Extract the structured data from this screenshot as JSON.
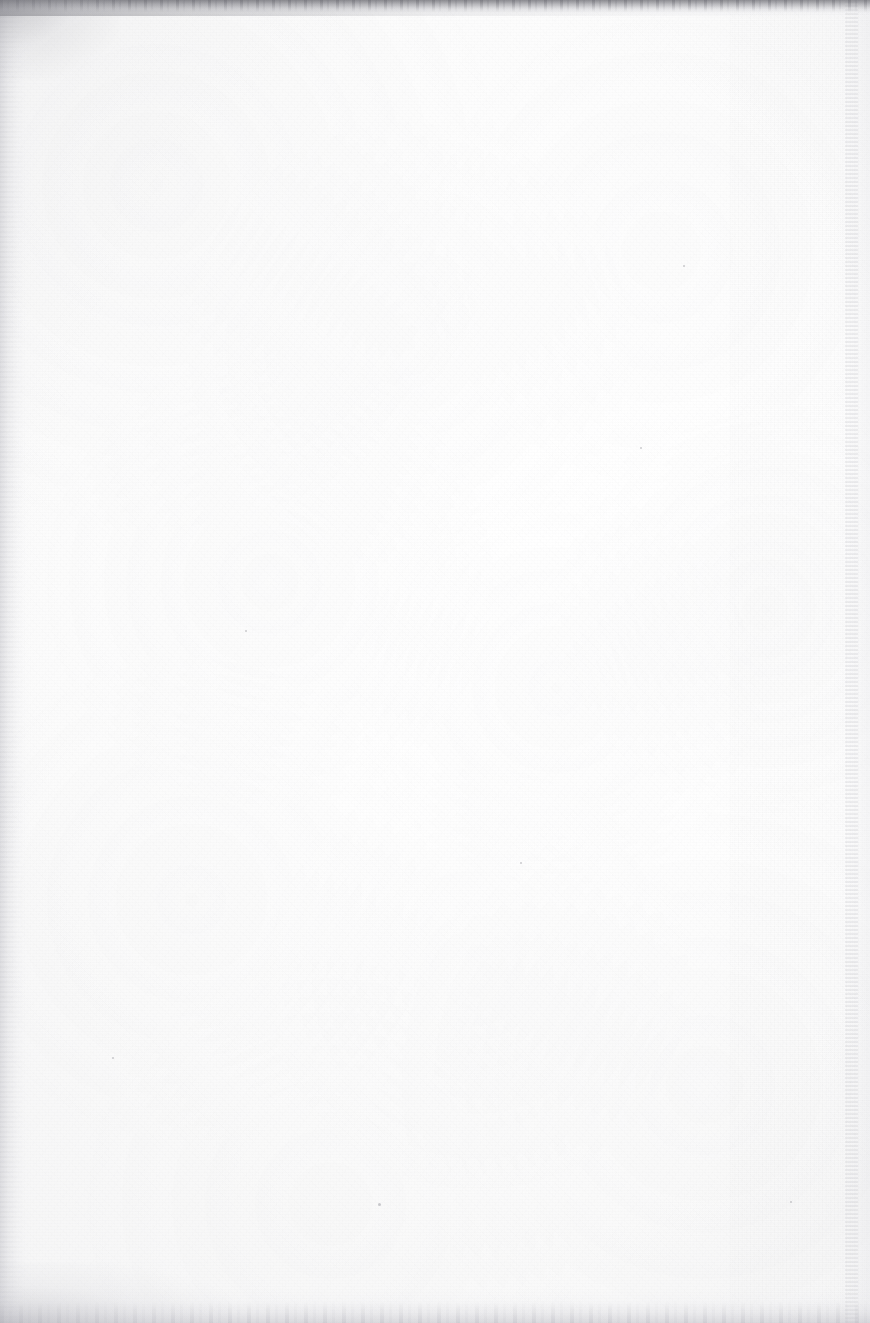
{
  "page": {
    "kind": "scanned-blank-page",
    "width_px": 870,
    "height_px": 1323,
    "text_content": "",
    "visible_text_blocks": [],
    "colors": {
      "paper_white": "#fdfdfd",
      "paper_highlight": "#ffffff",
      "paper_shadow": "#fafafa",
      "top_edge_dark": "#787880",
      "bottom_edge_grey": "#c4c4ca",
      "left_edge_grey": "#babac1",
      "right_streak_grey": "#acacb4",
      "speck_grey": "#808088"
    },
    "artifacts": [
      {
        "name": "top-scan-edge",
        "position": "top",
        "tone": "#787880",
        "thickness_px": 16,
        "note": "ragged dark scanner border, darkest at left"
      },
      {
        "name": "bottom-scan-edge",
        "position": "bottom",
        "tone": "#c4c4ca",
        "thickness_px": 34,
        "note": "soft light-grey band"
      },
      {
        "name": "left-edge-shadow",
        "position": "left",
        "tone": "#babac1",
        "thickness_px": 34,
        "note": "subtle vertical gradient darkening"
      },
      {
        "name": "right-edge-streak",
        "position": "right",
        "tone": "#acacb4",
        "thickness_px": 13,
        "note": "faint vertical streak at x≈845"
      },
      {
        "name": "corner-smudge-top-left",
        "position": "top-left",
        "tone": "#7d7d84"
      },
      {
        "name": "corner-smudge-bottom-left",
        "position": "bottom-left",
        "tone": "#a8a8af"
      },
      {
        "name": "grain-right-zone",
        "position": "x>730",
        "note": "slightly stronger fiber texture on right portion"
      }
    ],
    "specks": [
      {
        "x": 378,
        "y": 1203,
        "size": 3
      },
      {
        "x": 640,
        "y": 447,
        "size": 2
      },
      {
        "x": 790,
        "y": 1201,
        "size": 2
      },
      {
        "x": 245,
        "y": 630,
        "size": 2
      },
      {
        "x": 520,
        "y": 862,
        "size": 2
      },
      {
        "x": 112,
        "y": 1057,
        "size": 2
      },
      {
        "x": 683,
        "y": 265,
        "size": 2
      }
    ]
  }
}
